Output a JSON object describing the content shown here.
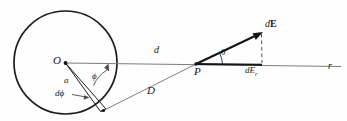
{
  "figure": {
    "kind": "physics-vector-diagram",
    "background_color": "#fefefe",
    "stroke_color": "#1b1c1e",
    "thin_stroke_color": "#6d6f73",
    "labels": {
      "center": "O",
      "radius": "a",
      "angle_phi": "ϕ",
      "element_dphi": "dϕ",
      "axial_distance": "d",
      "slant_distance": "D",
      "field_point": "P",
      "angle_theta": "θ",
      "field_vector_d": "d",
      "field_vector_E": "E",
      "field_component": "dE",
      "field_component_sub": "r",
      "axis": "r"
    },
    "geometry": {
      "circle_center_x": 65.5,
      "circle_center_y": 62.5,
      "circle_radius": 51.5,
      "point_P_x": 196,
      "point_P_y": 64,
      "axis_start_x": 65.5,
      "axis_end_x": 341,
      "dE_tip_x": 262,
      "dE_tip_y": 32,
      "dE_component_x": 262,
      "theta_degrees": 26,
      "phi_degrees": 62,
      "dphi_degrees": 8
    }
  }
}
